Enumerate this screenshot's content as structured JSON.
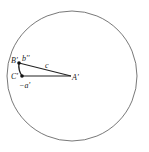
{
  "diagram": {
    "circle": {
      "cx": 72,
      "cy": 76,
      "r": 65,
      "stroke": "#555555"
    },
    "points": {
      "B": {
        "x": 19,
        "y": 63,
        "label": "B'"
      },
      "C": {
        "x": 22,
        "y": 76,
        "label": "C'"
      },
      "A": {
        "x": 71,
        "y": 76,
        "label": "A'"
      }
    },
    "labels": {
      "b": "b''",
      "c": "c",
      "a": "−a'"
    }
  }
}
